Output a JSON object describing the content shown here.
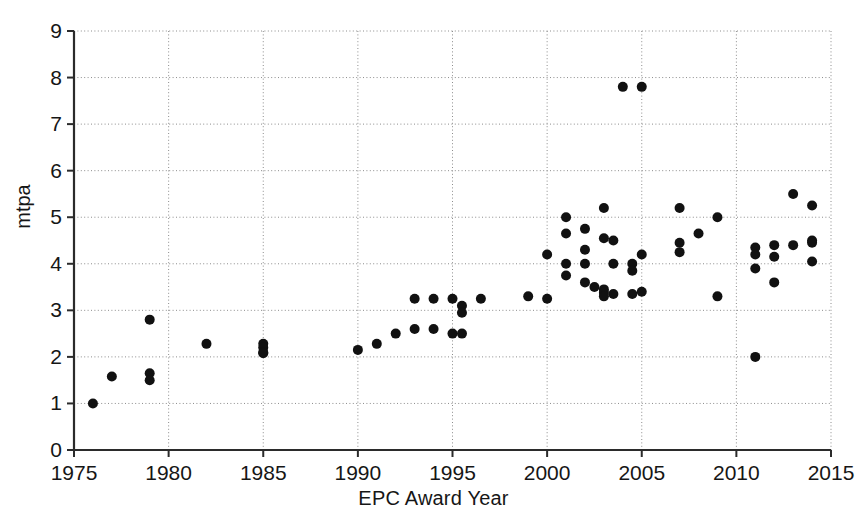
{
  "chart_data": {
    "type": "scatter",
    "title": "",
    "xlabel": "EPC Award Year",
    "ylabel": "mtpa",
    "xlim": [
      1975,
      2015
    ],
    "ylim": [
      0,
      9
    ],
    "xticks": [
      1975,
      1980,
      1985,
      1990,
      1995,
      2000,
      2005,
      2010,
      2015
    ],
    "yticks": [
      0,
      1,
      2,
      3,
      4,
      5,
      6,
      7,
      8,
      9
    ],
    "xtick_labels": [
      "1975",
      "1980",
      "1985",
      "1990",
      "1995",
      "2000",
      "2005",
      "2010",
      "2015"
    ],
    "ytick_labels": [
      "0",
      "1",
      "2",
      "3",
      "4",
      "5",
      "6",
      "7",
      "8",
      "9"
    ],
    "grid": true,
    "grid_style": "dotted",
    "legend": false,
    "marker": "filled-circle",
    "marker_color": "#111111",
    "marker_size_px": 5,
    "points": [
      {
        "x": 1976,
        "y": 1.0
      },
      {
        "x": 1977,
        "y": 1.58
      },
      {
        "x": 1979,
        "y": 2.8
      },
      {
        "x": 1979,
        "y": 1.65
      },
      {
        "x": 1979,
        "y": 1.5
      },
      {
        "x": 1982,
        "y": 2.28
      },
      {
        "x": 1985,
        "y": 2.28
      },
      {
        "x": 1985,
        "y": 2.2
      },
      {
        "x": 1985,
        "y": 2.1
      },
      {
        "x": 1985,
        "y": 2.08
      },
      {
        "x": 1990,
        "y": 2.15
      },
      {
        "x": 1991,
        "y": 2.28
      },
      {
        "x": 1992,
        "y": 2.5
      },
      {
        "x": 1993,
        "y": 2.6
      },
      {
        "x": 1993,
        "y": 3.25
      },
      {
        "x": 1994,
        "y": 3.25
      },
      {
        "x": 1994,
        "y": 2.6
      },
      {
        "x": 1995,
        "y": 3.25
      },
      {
        "x": 1995,
        "y": 2.5
      },
      {
        "x": 1995.5,
        "y": 3.1
      },
      {
        "x": 1995.5,
        "y": 2.95
      },
      {
        "x": 1995.5,
        "y": 2.5
      },
      {
        "x": 1996.5,
        "y": 3.25
      },
      {
        "x": 1999,
        "y": 3.3
      },
      {
        "x": 2000,
        "y": 4.2
      },
      {
        "x": 2000,
        "y": 3.25
      },
      {
        "x": 2001,
        "y": 5.0
      },
      {
        "x": 2001,
        "y": 4.65
      },
      {
        "x": 2001,
        "y": 4.0
      },
      {
        "x": 2001,
        "y": 3.75
      },
      {
        "x": 2002,
        "y": 4.75
      },
      {
        "x": 2002,
        "y": 4.3
      },
      {
        "x": 2002,
        "y": 4.0
      },
      {
        "x": 2002,
        "y": 3.6
      },
      {
        "x": 2002.5,
        "y": 3.5
      },
      {
        "x": 2003,
        "y": 5.2
      },
      {
        "x": 2003,
        "y": 4.55
      },
      {
        "x": 2003,
        "y": 3.45
      },
      {
        "x": 2003,
        "y": 3.38
      },
      {
        "x": 2003,
        "y": 3.3
      },
      {
        "x": 2003.5,
        "y": 4.5
      },
      {
        "x": 2003.5,
        "y": 4.0
      },
      {
        "x": 2003.5,
        "y": 3.35
      },
      {
        "x": 2004,
        "y": 7.8
      },
      {
        "x": 2004.5,
        "y": 4.0
      },
      {
        "x": 2004.5,
        "y": 3.85
      },
      {
        "x": 2004.5,
        "y": 3.35
      },
      {
        "x": 2005,
        "y": 7.8
      },
      {
        "x": 2005,
        "y": 4.2
      },
      {
        "x": 2005,
        "y": 3.4
      },
      {
        "x": 2007,
        "y": 5.2
      },
      {
        "x": 2007,
        "y": 4.45
      },
      {
        "x": 2007,
        "y": 4.25
      },
      {
        "x": 2008,
        "y": 4.65
      },
      {
        "x": 2009,
        "y": 5.0
      },
      {
        "x": 2009,
        "y": 3.3
      },
      {
        "x": 2011,
        "y": 4.35
      },
      {
        "x": 2011,
        "y": 4.2
      },
      {
        "x": 2011,
        "y": 3.9
      },
      {
        "x": 2011,
        "y": 2.0
      },
      {
        "x": 2012,
        "y": 4.4
      },
      {
        "x": 2012,
        "y": 4.15
      },
      {
        "x": 2012,
        "y": 3.6
      },
      {
        "x": 2013,
        "y": 5.5
      },
      {
        "x": 2013,
        "y": 4.4
      },
      {
        "x": 2014,
        "y": 5.25
      },
      {
        "x": 2014,
        "y": 4.5
      },
      {
        "x": 2014,
        "y": 4.45
      },
      {
        "x": 2014,
        "y": 4.05
      }
    ]
  }
}
